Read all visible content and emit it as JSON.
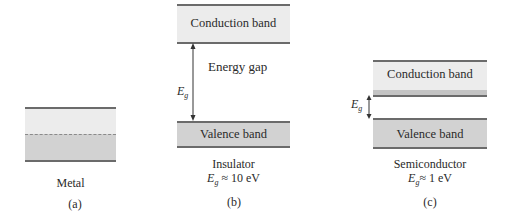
{
  "panels": [
    {
      "id": "a",
      "material": "Metal",
      "label": "(a)"
    },
    {
      "id": "b",
      "material": "Insulator",
      "conduction_band": "Conduction band",
      "valence_band": "Valence band",
      "gap_label": "Energy gap",
      "gap_symbol": "E",
      "gap_symbol_sub": "g",
      "gap_value": "≈ 10 eV",
      "label": "(b)"
    },
    {
      "id": "c",
      "material": "Semiconductor",
      "conduction_band": "Conduction band",
      "valence_band": "Valence band",
      "gap_symbol": "E",
      "gap_symbol_sub": "g",
      "gap_value": "≈ 1 eV",
      "label": "(c)"
    }
  ],
  "colors": {
    "band_light": "#ececec",
    "band_filled": "#d2d2d2",
    "edge_line": "#6b6b6b"
  }
}
